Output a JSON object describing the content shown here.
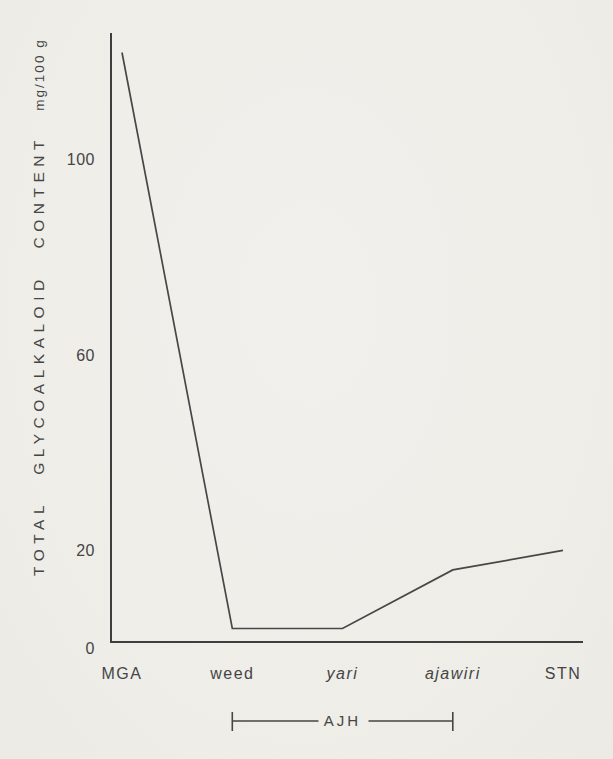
{
  "figure": {
    "background": "#efeee9",
    "ink_color": "#454545"
  },
  "chart_data": {
    "type": "line",
    "title": "",
    "xlabel": "",
    "ylabel": "TOTAL GLYCOALKALOID CONTENT",
    "ylabel_unit": "mg/100 g",
    "categories": [
      "MGA",
      "weed",
      "yari",
      "ajawiri",
      "STN"
    ],
    "italic_categories": [
      "yari",
      "ajawiri"
    ],
    "values": [
      122,
      4,
      4,
      16,
      20
    ],
    "yticks": [
      0,
      20,
      60,
      100
    ],
    "ylim": [
      0,
      126
    ],
    "grid": false,
    "legend": false,
    "group_bracket": {
      "label": "AJH",
      "from": "weed",
      "to": "ajawiri"
    }
  }
}
